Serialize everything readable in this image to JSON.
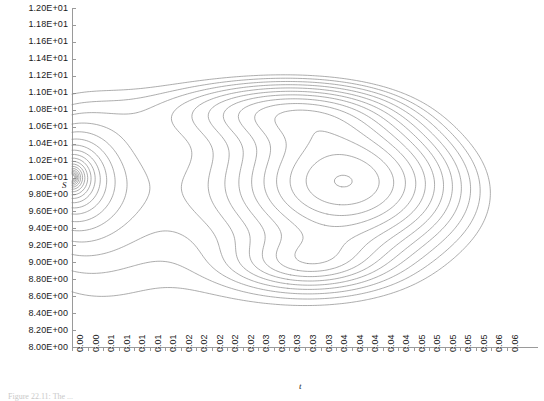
{
  "chart_data": {
    "type": "line",
    "subtype": "contour",
    "title": "",
    "xlabel": "t",
    "ylabel": "S",
    "xlim": [
      0.0,
      0.06
    ],
    "ylim": [
      8.0,
      12.0
    ],
    "grid": false,
    "legend": "none",
    "line_color": "#8a8a8a",
    "axis_color": "#9a9a9a",
    "background": "#ffffff",
    "y_ticks": [
      "8.00E+00",
      "8.20E+00",
      "8.40E+00",
      "8.60E+00",
      "8.80E+00",
      "9.00E+00",
      "9.20E+00",
      "9.40E+00",
      "9.60E+00",
      "9.80E+00",
      "1.00E+01",
      "1.02E+01",
      "1.04E+01",
      "1.06E+01",
      "1.08E+01",
      "1.10E+01",
      "1.12E+01",
      "1.14E+01",
      "1.16E+01",
      "1.18E+01",
      "1.20E+01"
    ],
    "y_tick_values": [
      8.0,
      8.2,
      8.4,
      8.6,
      8.8,
      9.0,
      9.2,
      9.4,
      9.6,
      9.8,
      10.0,
      10.2,
      10.4,
      10.6,
      10.8,
      11.0,
      11.2,
      11.4,
      11.6,
      11.8,
      12.0
    ],
    "x_ticks": [
      "0.00",
      "0.00",
      "0.01",
      "0.01",
      "0.01",
      "0.01",
      "0.01",
      "0.02",
      "0.02",
      "0.02",
      "0.02",
      "0.02",
      "0.03",
      "0.03",
      "0.03",
      "0.03",
      "0.03",
      "0.04",
      "0.04",
      "0.04",
      "0.04",
      "0.04",
      "0.05",
      "0.05",
      "0.05",
      "0.05",
      "0.05",
      "0.06",
      "0.06"
    ],
    "x_tick_values": [
      0.0,
      0.002,
      0.004,
      0.006,
      0.008,
      0.01,
      0.012,
      0.014,
      0.016,
      0.018,
      0.02,
      0.022,
      0.024,
      0.026,
      0.028,
      0.03,
      0.032,
      0.034,
      0.036,
      0.038,
      0.04,
      0.042,
      0.044,
      0.046,
      0.048,
      0.05,
      0.052,
      0.054,
      0.056
    ],
    "features": [
      {
        "name": "singularity",
        "t": 0.0,
        "S": 10.0
      },
      {
        "name": "closed-maximum-lobe",
        "t": 0.036,
        "S": 10.0
      },
      {
        "name": "small-closed-lobe",
        "t": 0.03,
        "S": 8.95
      },
      {
        "name": "upper-nested-lobe",
        "t": 0.026,
        "S": 10.85
      }
    ],
    "contour_levels": 26
  },
  "axis_titles": {
    "x": "t",
    "y": "S"
  },
  "caption": {
    "text": "Figure 22.11: The ..."
  }
}
